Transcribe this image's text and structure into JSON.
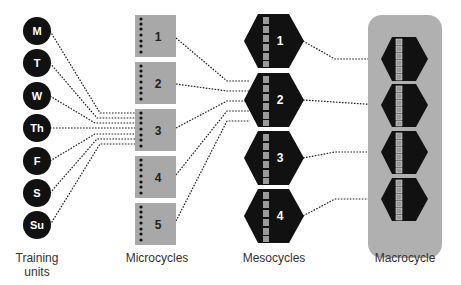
{
  "diagram": {
    "type": "training-periodization-hierarchy",
    "colors": {
      "background": "#ffffff",
      "circle_fill": "#111111",
      "micro_fill": "#a8a8a8",
      "hex_fill": "#111111",
      "hex_segment": "#9a9a9a",
      "macro_bg": "#b0b0b0",
      "connector": "#222222",
      "label_text": "#333333"
    },
    "training_units": {
      "label_line1": "Training",
      "label_line2": "units",
      "items": [
        "M",
        "T",
        "W",
        "Th",
        "F",
        "S",
        "Su"
      ]
    },
    "microcycles": {
      "label": "Microcycles",
      "items": [
        "1",
        "2",
        "3",
        "4",
        "5"
      ],
      "dots_per_item": 7
    },
    "mesocycles": {
      "label": "Mesocycles",
      "items": [
        "1",
        "2",
        "3",
        "4"
      ],
      "segments_per_item": 6
    },
    "macrocycle": {
      "label": "Macrocycle",
      "hexagon_count": 4
    },
    "connections": {
      "training_units_to_microcycle": "3",
      "microcycles_to_mesocycle": "2",
      "mesocycles_to_macrocycle": "all"
    }
  }
}
